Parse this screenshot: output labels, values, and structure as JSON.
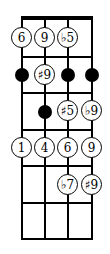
{
  "diagram": {
    "type": "fretboard",
    "strings": 4,
    "frets": 6,
    "colors": {
      "line": "#000000",
      "note_fill": "#ffffff",
      "dot": "#000000"
    },
    "positions": [
      {
        "row": 0,
        "string": 0,
        "kind": "label",
        "label": "6"
      },
      {
        "row": 0,
        "string": 1,
        "kind": "label",
        "label": "9"
      },
      {
        "row": 0,
        "string": 2,
        "kind": "label",
        "label": "♭5"
      },
      {
        "row": 1,
        "string": 0,
        "kind": "dot"
      },
      {
        "row": 1,
        "string": 1,
        "kind": "label",
        "label": "♯9"
      },
      {
        "row": 1,
        "string": 2,
        "kind": "dot"
      },
      {
        "row": 1,
        "string": 3,
        "kind": "dot"
      },
      {
        "row": 2,
        "string": 1,
        "kind": "dot"
      },
      {
        "row": 2,
        "string": 2,
        "kind": "label",
        "label": "♯5"
      },
      {
        "row": 2,
        "string": 3,
        "kind": "label",
        "label": "♭9"
      },
      {
        "row": 3,
        "string": 0,
        "kind": "label",
        "label": "1"
      },
      {
        "row": 3,
        "string": 1,
        "kind": "label",
        "label": "4"
      },
      {
        "row": 3,
        "string": 2,
        "kind": "label",
        "label": "6"
      },
      {
        "row": 3,
        "string": 3,
        "kind": "label",
        "label": "9"
      },
      {
        "row": 4,
        "string": 2,
        "kind": "label",
        "label": "♭7"
      },
      {
        "row": 4,
        "string": 3,
        "kind": "label",
        "label": "♯9"
      }
    ]
  }
}
